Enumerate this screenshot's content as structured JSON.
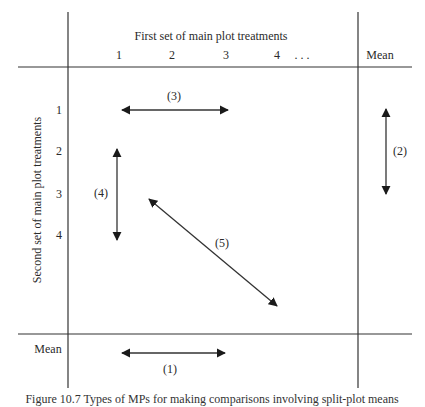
{
  "header": {
    "title": "First set of main plot treatments",
    "columns": [
      "1",
      "2",
      "3",
      "4",
      ". . ."
    ],
    "mean_column": "Mean"
  },
  "rows": {
    "axis_label": "Second set of main plot treatments",
    "labels": [
      "1",
      "2",
      "3",
      "4"
    ],
    "mean_row": "Mean"
  },
  "comparisons": [
    {
      "id": "1",
      "label": "(1)",
      "location": "mean row, horizontal between column 1 and column 3"
    },
    {
      "id": "2",
      "label": "(2)",
      "location": "mean column, vertical between row 1 and row 3"
    },
    {
      "id": "3",
      "label": "(3)",
      "location": "row 1, horizontal between column 1 and column 3"
    },
    {
      "id": "4",
      "label": "(4)",
      "location": "column 1, vertical between row 2 and row 4"
    },
    {
      "id": "5",
      "label": "(5)",
      "location": "diagonal from row 3 near column 1-2 to below row 4 at column 4"
    }
  ],
  "caption": "Figure 10.7 Types of MPs for making comparisons involving split-plot means"
}
